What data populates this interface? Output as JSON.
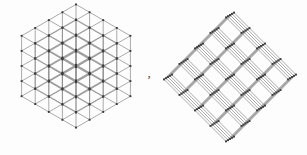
{
  "figure": {
    "caption": "",
    "separator_glyph": ",",
    "background_color": "#fdfdfd",
    "line_color": "#6f6f6f",
    "line_color_dark": "#4a4a4a",
    "node_color": "#3c3c3c",
    "panels": [
      {
        "id": "left",
        "name": "isometric-cubic-lattice",
        "description": "Triangular isometric projection of a cubic lattice fragment",
        "projection": "isometric",
        "symmetry": "3-fold",
        "axis_count": 3,
        "layers": 5,
        "node_shape": "square",
        "node_size_px": 1.9,
        "line_width_px": 0.7,
        "center_x": 76,
        "center_y": 66,
        "step_x": 13.6,
        "step_y": 7.85,
        "step_z": 15.1
      },
      {
        "id": "right",
        "name": "diagonal-square-lattice",
        "description": "Rotated square-net projection of the same lattice",
        "projection": "diagonal",
        "symmetry": "4-fold",
        "axis_count": 2,
        "layers": 5,
        "node_shape": "square",
        "node_size_px": 1.9,
        "line_width_px": 0.7,
        "center_x": 78,
        "center_y": 77,
        "step_a": 15.5,
        "step_b": 15.5,
        "skew": 0.13
      }
    ]
  },
  "chart_data": {
    "type": "scatter",
    "title": "",
    "xlabel": "",
    "ylabel": "",
    "grid": false,
    "legend_position": "none",
    "series": [
      {
        "name": "isometric-cubic-lattice-nodes",
        "panel": "left",
        "lattice_dimensions": [
          5,
          5,
          5
        ],
        "basis_vectors": [
          [
            13.6,
            7.85
          ],
          [
            -13.6,
            7.85
          ],
          [
            0,
            -15.1
          ]
        ],
        "origin": [
          76,
          66
        ],
        "node_count": 125,
        "edge_count": 300
      },
      {
        "name": "diagonal-square-lattice-nodes",
        "panel": "right",
        "lattice_dimensions": [
          5,
          5,
          5
        ],
        "basis_vectors": [
          [
            15.5,
            15.5
          ],
          [
            -15.5,
            15.5
          ],
          [
            2.0,
            -1.2
          ]
        ],
        "origin": [
          78,
          77
        ],
        "node_count": 125,
        "edge_count": 300
      }
    ]
  }
}
